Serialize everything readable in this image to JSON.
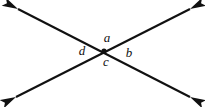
{
  "figure": {
    "kind": "geometry-diagram",
    "background_color": "#ffffff",
    "stroke_color": "#111111",
    "stroke_width": 2.1
  },
  "intersection": {
    "label": "intersection-point",
    "x": 104,
    "y": 51,
    "dot_radius": 2.6,
    "color": "#111111"
  },
  "lines": [
    {
      "name": "line-upper-left-to-lower-right",
      "x1": 18,
      "y1": 9,
      "x2": 190,
      "y2": 97,
      "arrow_start": true,
      "arrow_end": true
    },
    {
      "name": "line-lower-left-to-upper-right",
      "x1": 16,
      "y1": 97,
      "x2": 190,
      "y2": 9,
      "arrow_start": true,
      "arrow_end": true
    }
  ],
  "arrowheads": [
    {
      "name": "arrowhead-upper-left",
      "x": 18,
      "y": 9,
      "angle": 207
    },
    {
      "name": "arrowhead-upper-right",
      "x": 190,
      "y": 9,
      "angle": 333
    },
    {
      "name": "arrowhead-lower-left",
      "x": 16,
      "y": 97,
      "angle": 153
    },
    {
      "name": "arrowhead-lower-right",
      "x": 190,
      "y": 97,
      "angle": 27
    }
  ],
  "labels": [
    {
      "name": "angle-label-a",
      "text": "a",
      "x": 107,
      "y": 39,
      "position": "top"
    },
    {
      "name": "angle-label-b",
      "text": "b",
      "x": 129,
      "y": 54,
      "position": "right"
    },
    {
      "name": "angle-label-c",
      "text": "c",
      "x": 106,
      "y": 63,
      "position": "bottom"
    },
    {
      "name": "angle-label-d",
      "text": "d",
      "x": 82,
      "y": 52,
      "position": "left"
    }
  ]
}
